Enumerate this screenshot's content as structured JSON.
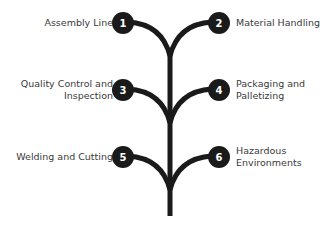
{
  "diagram": {
    "title": "",
    "stem_color": "#1a1a1a",
    "node_color": "#1a1a1a",
    "number_color": "#ffffff",
    "text_color": "#3a3a3a",
    "nodes": [
      {
        "number": "1",
        "line1": "Assembly Line",
        "line2": "",
        "side": "left"
      },
      {
        "number": "2",
        "line1": "Material Handling",
        "line2": "",
        "side": "right"
      },
      {
        "number": "3",
        "line1": "Quality Control and",
        "line2": "Inspection",
        "side": "left"
      },
      {
        "number": "4",
        "line1": "Packaging and",
        "line2": "Palletizing",
        "side": "right"
      },
      {
        "number": "5",
        "line1": "Welding and Cutting",
        "line2": "",
        "side": "left"
      },
      {
        "number": "6",
        "line1": "Hazardous",
        "line2": "Environments",
        "side": "right"
      }
    ]
  }
}
